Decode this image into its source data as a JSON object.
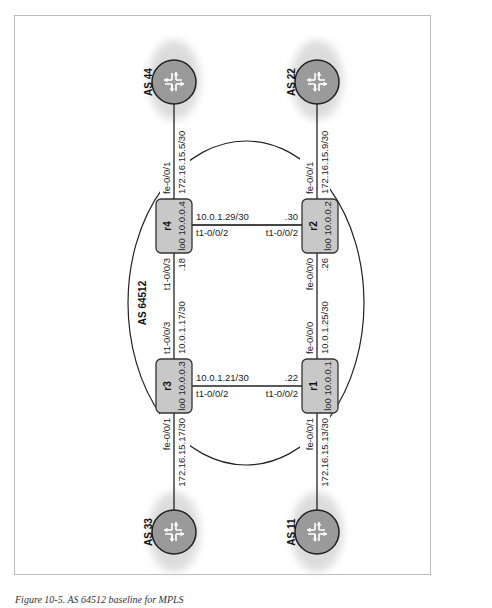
{
  "figure": {
    "caption": "Figure 10-5. AS 64512 baseline for MPLS",
    "domain_label": "AS 64512",
    "colors": {
      "router_fill": "#c8c8c8",
      "router_stroke": "#333333",
      "as_circle_fill": "#9a9a9a",
      "cloud_fill": "#e6e6e6",
      "line": "#222222",
      "frame": "#bdbdbd"
    }
  },
  "routers": [
    {
      "id": "r4",
      "name": "r4",
      "loopback": "lo0 10.0.0.4"
    },
    {
      "id": "r2",
      "name": "r2",
      "loopback": "lo0 10.0.0.2"
    },
    {
      "id": "r3",
      "name": "r3",
      "loopback": "lo0 10.0.0.3"
    },
    {
      "id": "r1",
      "name": "r1",
      "loopback": "lo0 10.0.0.1"
    }
  ],
  "external_as": [
    {
      "id": "as44",
      "label": "AS 44",
      "icon": "router-icon"
    },
    {
      "id": "as22",
      "label": "AS 22",
      "icon": "router-icon"
    },
    {
      "id": "as33",
      "label": "AS 33",
      "icon": "router-icon"
    },
    {
      "id": "as11",
      "label": "AS 11",
      "icon": "router-icon"
    }
  ],
  "links": {
    "r4_as44": {
      "interface": "fe-0/0/1",
      "subnet": "172.16.15.5/30"
    },
    "r2_as22": {
      "interface": "fe-0/0/1",
      "subnet": "172.16.15.9/30"
    },
    "r3_as33": {
      "interface": "fe-0/0/1",
      "subnet": "172.16.15.17/30"
    },
    "r1_as11": {
      "interface": "fe-0/0/1",
      "subnet": "172.16.15.13/30"
    },
    "r4_r2": {
      "subnet": "10.0.1.29/30",
      "r4_if": "t1-0/0/2",
      "r2_if": "t1-0/0/2",
      "r2_host": ".30"
    },
    "r3_r1": {
      "subnet": "10.0.1.21/30",
      "r3_if": "t1-0/0/2",
      "r1_if": "t1-0/0/2",
      "r1_host": ".22"
    },
    "r4_r3": {
      "subnet": "10.0.1.17/30",
      "r4_if": "t1-0/0/3",
      "r3_if": "t1-0/0/3",
      "r4_host": ".18"
    },
    "r2_r1": {
      "subnet": "10.0.1.25/30",
      "r2_if": "fe-0/0/0",
      "r1_if": "fe-0/0/0",
      "r2_host": ".26"
    }
  }
}
